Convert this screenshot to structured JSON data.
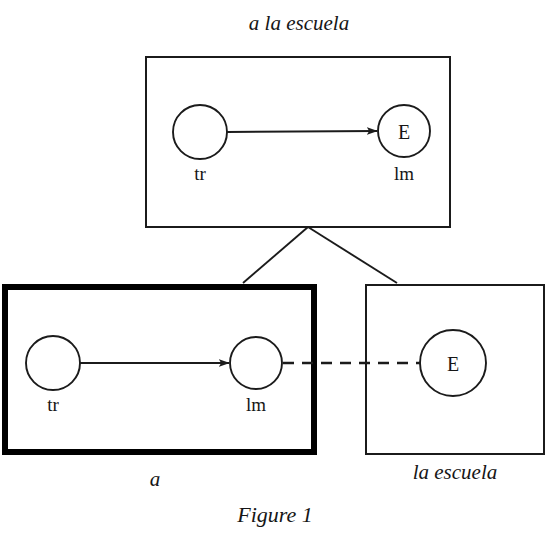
{
  "figure": {
    "caption": "Figure 1",
    "background_color": "#ffffff",
    "ink_color": "#161616"
  },
  "boxes": {
    "top": {
      "label": "a la escuela",
      "label_style": "italic",
      "border": "thin",
      "nodes": [
        {
          "id": "tr-top",
          "inner_text": "",
          "label": "tr"
        },
        {
          "id": "lm-top",
          "inner_text": "E",
          "label": "lm"
        }
      ],
      "edge": {
        "type": "solid-arrow",
        "from": "tr-top",
        "to": "lm-top"
      }
    },
    "left": {
      "label": "a",
      "label_style": "italic",
      "border": "thick",
      "nodes": [
        {
          "id": "tr-left",
          "inner_text": "",
          "label": "tr"
        },
        {
          "id": "lm-left",
          "inner_text": "",
          "label": "lm"
        }
      ],
      "edge": {
        "type": "solid-arrow",
        "from": "tr-left",
        "to": "lm-left"
      }
    },
    "right": {
      "label": "la escuela",
      "label_style": "italic",
      "border": "thin",
      "nodes": [
        {
          "id": "e-right",
          "inner_text": "E",
          "label": ""
        }
      ]
    }
  },
  "connectors": {
    "composition_apex_to_left": "line",
    "composition_apex_to_right": "line",
    "correspondence": {
      "type": "dashed",
      "from": "lm-left",
      "to": "e-right"
    }
  }
}
